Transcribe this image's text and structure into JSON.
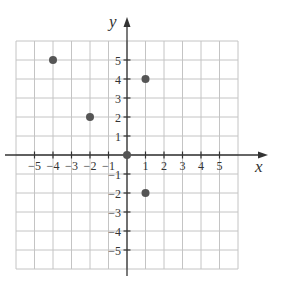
{
  "chart_data": {
    "type": "scatter",
    "title": "",
    "xlabel": "x",
    "ylabel": "y",
    "xlim": [
      -6,
      6
    ],
    "ylim": [
      -6,
      6
    ],
    "grid": true,
    "x_ticks": [
      -5,
      -4,
      -3,
      -2,
      -1,
      1,
      2,
      3,
      4,
      5
    ],
    "y_ticks": [
      -5,
      -4,
      -3,
      -2,
      -1,
      1,
      2,
      3,
      4,
      5
    ],
    "x_tick_labels": [
      "−5",
      "−4",
      "−3",
      "−2",
      "−1",
      "1",
      "2",
      "3",
      "4",
      "5"
    ],
    "y_tick_labels": [
      "−5",
      "−4",
      "−3",
      "−2",
      "−1",
      "1",
      "2",
      "3",
      "4",
      "5"
    ],
    "points": [
      {
        "x": -4,
        "y": 5
      },
      {
        "x": -2,
        "y": 2
      },
      {
        "x": 0,
        "y": 0
      },
      {
        "x": 1,
        "y": 4
      },
      {
        "x": 1,
        "y": -2
      }
    ],
    "colors": {
      "grid": "#c4c4c4",
      "axis": "#333333",
      "point": "#555555"
    }
  }
}
